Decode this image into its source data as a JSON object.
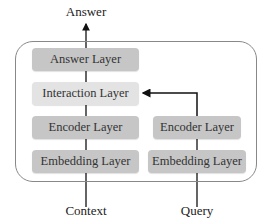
{
  "diagram": {
    "output_label": "Answer",
    "left_column": {
      "input_label": "Context",
      "layers": [
        {
          "label": "Answer Layer",
          "shade": "dark"
        },
        {
          "label": "Interaction Layer",
          "shade": "light"
        },
        {
          "label": "Encoder Layer",
          "shade": "dark"
        },
        {
          "label": "Embedding Layer",
          "shade": "dark"
        }
      ]
    },
    "right_column": {
      "input_label": "Query",
      "layers": [
        {
          "label": "Encoder Layer",
          "shade": "dark"
        },
        {
          "label": "Embedding Layer",
          "shade": "dark"
        }
      ]
    },
    "colors": {
      "dark_box": "#c6c6c6",
      "light_box": "#e3e3e3",
      "frame": "#888888",
      "line": "#111111"
    }
  }
}
